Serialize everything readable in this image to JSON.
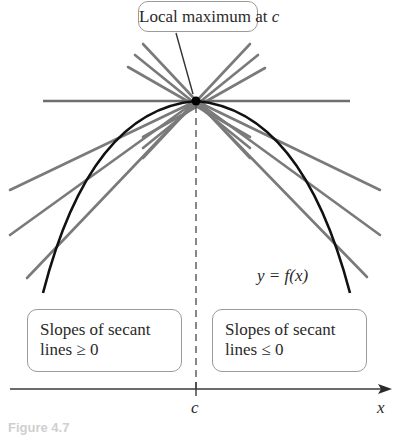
{
  "figure": {
    "title_label": "Local maximum at c",
    "title_prefix": "Local maximum at ",
    "title_var": "c",
    "function_label": "y = f(x)",
    "left_box": {
      "line1": "Slopes of secant",
      "line2": "lines ≥ 0"
    },
    "right_box": {
      "line1": "Slopes of secant",
      "line2": "lines ≤ 0"
    },
    "x_axis_label": "x",
    "c_tick_label": "c",
    "caption": "Figure 4.7"
  },
  "colors": {
    "curve": "#111111",
    "secant": "#777777",
    "tangent": "#6e6e6e",
    "axis": "#3a3a3a",
    "box_border": "#9a9a9a",
    "point": "#000000"
  }
}
